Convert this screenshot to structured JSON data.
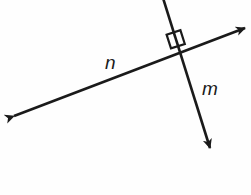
{
  "figure": {
    "background_color": "#fefefe",
    "stroke_color": "#1a1a1a",
    "width": 251,
    "height": 195
  },
  "labels": {
    "line_n": "n",
    "line_m": "m"
  },
  "geometry": {
    "intersection": {
      "x": 184,
      "y": 53
    },
    "line_n": {
      "name": "n",
      "start": {
        "x": 10,
        "y": 118
      },
      "end": {
        "x": 248,
        "y": 27
      },
      "arrowheads": "both",
      "label_position": {
        "x": 105,
        "y": 69
      }
    },
    "line_m": {
      "name": "m",
      "start": {
        "x": 163,
        "y": 0
      },
      "end": {
        "x": 212,
        "y": 152
      },
      "arrowheads": "end",
      "label_position": {
        "x": 202,
        "y": 95
      }
    },
    "right_angle_marker": {
      "present": true,
      "quadrant": "upper-left",
      "size": 14,
      "angle_degrees": 90
    }
  }
}
